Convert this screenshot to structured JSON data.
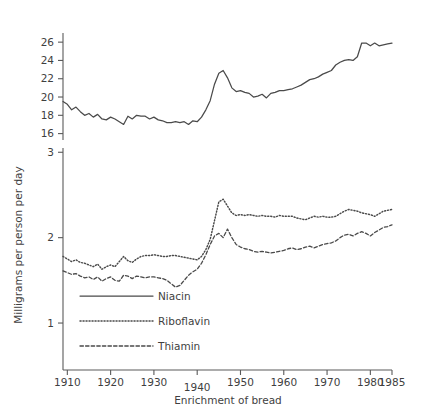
{
  "chart_data": {
    "type": "line",
    "title": "",
    "subtitle": "",
    "xlabel": "Enrichment of bread",
    "ylabel": "Milligrams per person per day",
    "xlim": [
      1909,
      1985
    ],
    "grid": false,
    "legend_position": "inside-bottom-left",
    "panels": [
      {
        "name": "niacin-panel",
        "ylim": [
          15.3,
          27.0
        ],
        "yticks": [
          16,
          18,
          20,
          22,
          24,
          26
        ],
        "ytick_labels": [
          "16",
          "18",
          "20",
          "22",
          "24",
          "26"
        ]
      },
      {
        "name": "riboflavin-thiamin-panel",
        "ylim": [
          0.45,
          3.05
        ],
        "yticks": [
          1,
          2,
          3
        ],
        "ytick_labels": [
          "1",
          "2",
          "3"
        ]
      }
    ],
    "xticks": [
      1910,
      1920,
      1930,
      1940,
      1950,
      1960,
      1970,
      1980,
      1985
    ],
    "xtick_labels": [
      "1910",
      "1920",
      "1930",
      "1940",
      "1950",
      "1960",
      "1970",
      "1980",
      "1985"
    ],
    "x": [
      1909,
      1910,
      1911,
      1912,
      1913,
      1914,
      1915,
      1916,
      1917,
      1918,
      1919,
      1920,
      1921,
      1922,
      1923,
      1924,
      1925,
      1926,
      1927,
      1928,
      1929,
      1930,
      1931,
      1932,
      1933,
      1934,
      1935,
      1936,
      1937,
      1938,
      1939,
      1940,
      1941,
      1942,
      1943,
      1944,
      1945,
      1946,
      1947,
      1948,
      1949,
      1950,
      1951,
      1952,
      1953,
      1954,
      1955,
      1956,
      1957,
      1958,
      1959,
      1960,
      1961,
      1962,
      1963,
      1964,
      1965,
      1966,
      1967,
      1968,
      1969,
      1970,
      1971,
      1972,
      1973,
      1974,
      1975,
      1976,
      1977,
      1978,
      1979,
      1980,
      1981,
      1982,
      1983,
      1984,
      1985
    ],
    "series": [
      {
        "name": "Niacin",
        "panel": 0,
        "style": "solid",
        "values": [
          19.5,
          19.2,
          18.6,
          18.9,
          18.4,
          18.0,
          18.2,
          17.8,
          18.1,
          17.6,
          17.5,
          17.8,
          17.6,
          17.3,
          17.0,
          17.9,
          17.6,
          18.0,
          17.9,
          17.9,
          17.6,
          17.8,
          17.5,
          17.4,
          17.2,
          17.2,
          17.3,
          17.2,
          17.3,
          17.0,
          17.4,
          17.3,
          17.8,
          18.6,
          19.6,
          21.4,
          22.6,
          22.9,
          22.1,
          21.0,
          20.6,
          20.7,
          20.5,
          20.4,
          20.0,
          20.1,
          20.3,
          19.9,
          20.4,
          20.5,
          20.7,
          20.7,
          20.8,
          20.9,
          21.1,
          21.3,
          21.6,
          21.9,
          22.0,
          22.2,
          22.5,
          22.7,
          22.9,
          23.5,
          23.8,
          24.0,
          24.1,
          24.0,
          24.4,
          25.9,
          25.9,
          25.6,
          25.9,
          25.6,
          25.7,
          25.8,
          25.9
        ]
      },
      {
        "name": "Riboflavin",
        "panel": 1,
        "style": "dotted",
        "values": [
          1.78,
          1.75,
          1.72,
          1.74,
          1.71,
          1.7,
          1.68,
          1.66,
          1.69,
          1.63,
          1.66,
          1.68,
          1.66,
          1.72,
          1.78,
          1.73,
          1.71,
          1.75,
          1.78,
          1.79,
          1.79,
          1.8,
          1.79,
          1.78,
          1.78,
          1.79,
          1.79,
          1.78,
          1.77,
          1.76,
          1.75,
          1.74,
          1.78,
          1.86,
          1.98,
          2.2,
          2.42,
          2.45,
          2.37,
          2.29,
          2.26,
          2.27,
          2.26,
          2.27,
          2.26,
          2.25,
          2.26,
          2.25,
          2.25,
          2.24,
          2.26,
          2.25,
          2.25,
          2.25,
          2.23,
          2.22,
          2.21,
          2.23,
          2.25,
          2.24,
          2.25,
          2.24,
          2.24,
          2.25,
          2.28,
          2.31,
          2.33,
          2.32,
          2.31,
          2.29,
          2.28,
          2.27,
          2.25,
          2.28,
          2.31,
          2.32,
          2.33
        ]
      },
      {
        "name": "Thiamin",
        "panel": 1,
        "style": "dashed",
        "values": [
          1.61,
          1.59,
          1.57,
          1.58,
          1.55,
          1.53,
          1.54,
          1.51,
          1.54,
          1.49,
          1.52,
          1.54,
          1.5,
          1.49,
          1.56,
          1.55,
          1.52,
          1.55,
          1.54,
          1.53,
          1.54,
          1.54,
          1.53,
          1.52,
          1.5,
          1.46,
          1.42,
          1.44,
          1.5,
          1.56,
          1.6,
          1.63,
          1.7,
          1.8,
          1.92,
          2.02,
          2.05,
          2.0,
          2.1,
          2.0,
          1.92,
          1.89,
          1.87,
          1.86,
          1.84,
          1.83,
          1.84,
          1.83,
          1.82,
          1.83,
          1.84,
          1.85,
          1.87,
          1.88,
          1.86,
          1.87,
          1.89,
          1.9,
          1.88,
          1.9,
          1.92,
          1.93,
          1.94,
          1.96,
          2.0,
          2.03,
          2.04,
          2.02,
          2.05,
          2.07,
          2.05,
          2.02,
          2.06,
          2.09,
          2.12,
          2.13,
          2.15
        ]
      }
    ]
  },
  "legend": {
    "items": [
      {
        "label": "Niacin",
        "style": "solid"
      },
      {
        "label": "Riboflavin",
        "style": "dotted"
      },
      {
        "label": "Thiamin",
        "style": "dashed"
      }
    ]
  },
  "axes": {
    "y_axis_title": "Milligrams per person per day",
    "x_axis_title": "Enrichment of bread"
  },
  "colors": {
    "line": "#4a4a4a",
    "axis": "#5a5a5a",
    "text": "#3f3f3f",
    "background": "#ffffff"
  }
}
